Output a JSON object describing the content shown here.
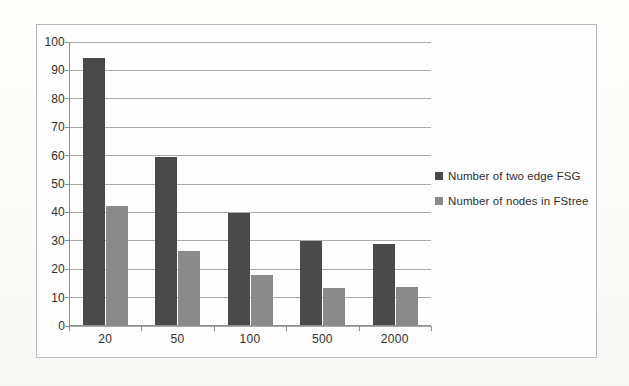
{
  "chart_data": {
    "type": "bar",
    "title": "",
    "xlabel": "",
    "ylabel": "",
    "categories": [
      "20",
      "50",
      "100",
      "500",
      "2000"
    ],
    "series": [
      {
        "name": "Number of two edge FSG",
        "color": "#4a4a4a",
        "values": [
          94,
          59,
          39.5,
          29.5,
          28.5
        ]
      },
      {
        "name": "Number of nodes in FStree",
        "color": "#8a8a8a",
        "values": [
          42,
          26,
          17.5,
          13,
          13.5
        ]
      }
    ],
    "ylim": [
      0,
      100
    ],
    "y_ticks": [
      0,
      10,
      20,
      30,
      40,
      50,
      60,
      70,
      80,
      90,
      100
    ],
    "y_tick_labels": [
      "0",
      "10",
      "20",
      "30",
      "40",
      "50",
      "60",
      "70",
      "80",
      "90",
      "100"
    ],
    "grid": true,
    "legend_position": "right",
    "plot_background": "#fefefe",
    "gridline_color": "#a9a9a7",
    "axis_color": "#8e8e8c",
    "border_color": "#b9b9b7"
  }
}
